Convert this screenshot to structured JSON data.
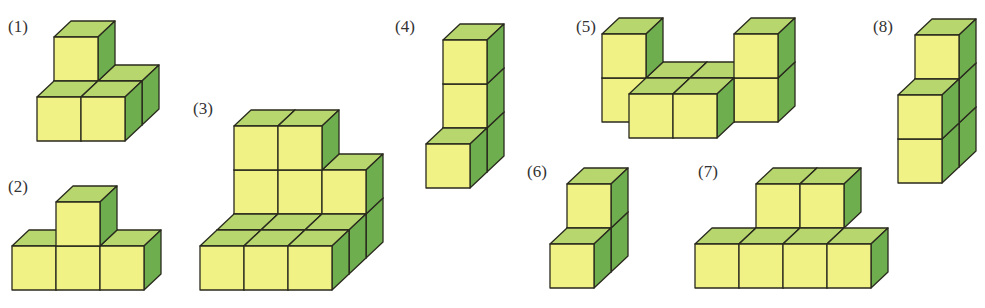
{
  "colors": {
    "front": "#f0f285",
    "top": "#b7d76e",
    "side": "#6fae4f",
    "edge": "#2a2a1e",
    "label": "#333333"
  },
  "cube": {
    "size": 44,
    "depth_dx": 17,
    "depth_dy": -16
  },
  "figures": [
    {
      "label": "(1)",
      "label_pos": [
        8,
        33
      ],
      "origin": [
        37,
        141
      ],
      "cubes": [
        [
          0,
          0,
          1
        ],
        [
          1,
          0,
          1
        ],
        [
          0,
          0,
          0
        ],
        [
          1,
          0,
          0
        ],
        [
          0,
          1,
          1
        ]
      ]
    },
    {
      "label": "(2)",
      "label_pos": [
        8,
        193
      ],
      "origin": [
        12,
        290
      ],
      "cubes": [
        [
          0,
          0,
          0
        ],
        [
          1,
          0,
          0
        ],
        [
          2,
          0,
          0
        ],
        [
          1,
          1,
          0
        ]
      ]
    },
    {
      "label": "(3)",
      "label_pos": [
        193,
        115
      ],
      "origin": [
        200,
        290
      ],
      "cubes": [
        [
          0,
          0,
          2
        ],
        [
          1,
          0,
          2
        ],
        [
          2,
          0,
          2
        ],
        [
          0,
          1,
          2
        ],
        [
          1,
          1,
          2
        ],
        [
          2,
          1,
          2
        ],
        [
          0,
          2,
          2
        ],
        [
          1,
          2,
          2
        ],
        [
          0,
          0,
          1
        ],
        [
          1,
          0,
          1
        ],
        [
          2,
          0,
          1
        ],
        [
          0,
          0,
          0
        ],
        [
          1,
          0,
          0
        ],
        [
          2,
          0,
          0
        ]
      ]
    },
    {
      "label": "(4)",
      "label_pos": [
        395,
        33
      ],
      "origin": [
        426,
        188
      ],
      "cubes": [
        [
          0,
          0,
          1
        ],
        [
          0,
          1,
          1
        ],
        [
          0,
          2,
          1
        ],
        [
          0,
          0,
          0
        ]
      ]
    },
    {
      "label": "(5)",
      "label_pos": [
        576,
        33
      ],
      "origin": [
        629,
        138
      ],
      "cubes": [
        [
          -1,
          0,
          1
        ],
        [
          -1,
          1,
          1
        ],
        [
          0,
          0,
          1
        ],
        [
          1,
          0,
          1
        ],
        [
          2,
          0,
          1
        ],
        [
          2,
          1,
          1
        ],
        [
          0,
          0,
          0
        ],
        [
          1,
          0,
          0
        ]
      ]
    },
    {
      "label": "(6)",
      "label_pos": [
        527,
        178
      ],
      "origin": [
        550,
        288
      ],
      "cubes": [
        [
          0,
          0,
          1
        ],
        [
          0,
          1,
          1
        ],
        [
          0,
          0,
          0
        ]
      ]
    },
    {
      "label": "(7)",
      "label_pos": [
        698,
        178
      ],
      "origin": [
        695,
        288
      ],
      "cubes": [
        [
          1,
          1,
          1
        ],
        [
          2,
          1,
          1
        ],
        [
          0,
          0,
          0
        ],
        [
          1,
          0,
          0
        ],
        [
          2,
          0,
          0
        ],
        [
          3,
          0,
          0
        ]
      ]
    },
    {
      "label": "(8)",
      "label_pos": [
        873,
        33
      ],
      "origin": [
        898,
        183
      ],
      "cubes": [
        [
          0,
          0,
          1
        ],
        [
          0,
          1,
          1
        ],
        [
          0,
          2,
          1
        ],
        [
          0,
          0,
          0
        ],
        [
          0,
          1,
          0
        ]
      ]
    }
  ]
}
